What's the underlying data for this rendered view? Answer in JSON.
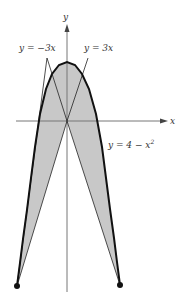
{
  "figure": {
    "axes": {
      "x_label": "x",
      "y_label": "y"
    },
    "curves": [
      {
        "name": "line-neg",
        "label": "y = −3x"
      },
      {
        "name": "line-pos",
        "label": "y = 3x"
      },
      {
        "name": "parabola",
        "label_main": "y = 4 − x",
        "label_sup": "2"
      }
    ],
    "colors": {
      "fill": "#c8c8c8",
      "curve": "#111111",
      "axis": "#666666"
    }
  }
}
